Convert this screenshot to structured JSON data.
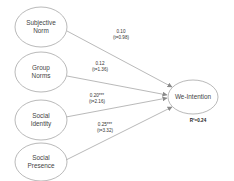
{
  "diagram": {
    "type": "path-model",
    "predictors": [
      {
        "id": "subjective-norm",
        "line1": "Subjective",
        "line2": "Norm"
      },
      {
        "id": "group-norms",
        "line1": "Group",
        "line2": "Norms"
      },
      {
        "id": "social-identity",
        "line1": "Social",
        "line2": "Identity"
      },
      {
        "id": "social-presence",
        "line1": "Social",
        "line2": "Presence"
      }
    ],
    "outcome": {
      "id": "we-intention",
      "label": "We-Intention",
      "r_squared": "R²=0.24"
    },
    "paths": [
      {
        "from": "subjective-norm",
        "coef": "0.10",
        "t": "(t=0.98)"
      },
      {
        "from": "group-norms",
        "coef": "0.12",
        "t": "(t=1.36)"
      },
      {
        "from": "social-identity",
        "coef": "0.20***",
        "t": "(t=2.16)"
      },
      {
        "from": "social-presence",
        "coef": "0.25***",
        "t": "(t=3.32)"
      }
    ]
  },
  "colors": {
    "stroke": "#8a8a8a",
    "text": "#444444",
    "background": "#ffffff"
  }
}
